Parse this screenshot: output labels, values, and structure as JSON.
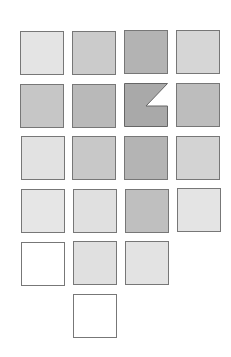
{
  "diagram": {
    "type": "tile-grid",
    "tiles": [
      {
        "row": 1,
        "col": 1,
        "x": 20,
        "y": 31,
        "fill": "#e4e4e4"
      },
      {
        "row": 1,
        "col": 2,
        "x": 72,
        "y": 31,
        "fill": "#cbcbcb"
      },
      {
        "row": 1,
        "col": 3,
        "x": 124,
        "y": 30,
        "fill": "#b3b3b3"
      },
      {
        "row": 1,
        "col": 4,
        "x": 176,
        "y": 30,
        "fill": "#d6d6d6"
      },
      {
        "row": 2,
        "col": 1,
        "x": 20,
        "y": 84,
        "fill": "#c6c6c6"
      },
      {
        "row": 2,
        "col": 2,
        "x": 72,
        "y": 84,
        "fill": "#b9b9b9"
      },
      {
        "row": 2,
        "col": 3,
        "x": 124,
        "y": 83,
        "fill": "#a9a9a9",
        "notched": true
      },
      {
        "row": 2,
        "col": 4,
        "x": 176,
        "y": 83,
        "fill": "#bdbdbd"
      },
      {
        "row": 3,
        "col": 1,
        "x": 21,
        "y": 136,
        "fill": "#e2e2e2"
      },
      {
        "row": 3,
        "col": 2,
        "x": 72,
        "y": 136,
        "fill": "#c8c8c8"
      },
      {
        "row": 3,
        "col": 3,
        "x": 124,
        "y": 136,
        "fill": "#b4b4b4"
      },
      {
        "row": 3,
        "col": 4,
        "x": 176,
        "y": 136,
        "fill": "#d3d3d3"
      },
      {
        "row": 4,
        "col": 1,
        "x": 21,
        "y": 189,
        "fill": "#e6e6e6"
      },
      {
        "row": 4,
        "col": 2,
        "x": 73,
        "y": 189,
        "fill": "#e0e0e0"
      },
      {
        "row": 4,
        "col": 3,
        "x": 125,
        "y": 189,
        "fill": "#bfbfbf"
      },
      {
        "row": 4,
        "col": 4,
        "x": 177,
        "y": 188,
        "fill": "#e4e4e4"
      },
      {
        "row": 5,
        "col": 1,
        "x": 21,
        "y": 242,
        "fill": "#ffffff"
      },
      {
        "row": 5,
        "col": 2,
        "x": 73,
        "y": 241,
        "fill": "#e0e0e0"
      },
      {
        "row": 5,
        "col": 3,
        "x": 125,
        "y": 241,
        "fill": "#e3e3e3"
      },
      {
        "row": 6,
        "col": 2,
        "x": 73,
        "y": 294,
        "fill": "#ffffff"
      }
    ]
  }
}
